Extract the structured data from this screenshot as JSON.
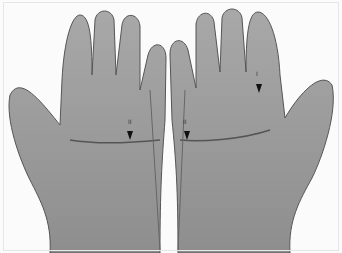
{
  "image": {
    "subject": "Two open palms facing viewer, grayscale photograph",
    "background": "#ffffff",
    "skin_tone": "#9a9a9a",
    "annotations": [
      {
        "label": "I",
        "position": "upper right palm near index finger base",
        "arrow": "down"
      },
      {
        "label": "II",
        "position": "left palm center",
        "arrow": "down"
      },
      {
        "label": "II",
        "position": "right palm center",
        "arrow": "down"
      }
    ]
  }
}
